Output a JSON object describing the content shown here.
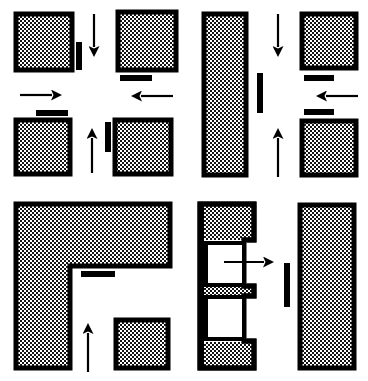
{
  "figure": {
    "title": "",
    "type": "patent-line-diagram",
    "background_color": "#ffffff",
    "stroke_color": "#000000",
    "fill_pattern": "stipple-dots",
    "fill_base_color": "#ffffff",
    "dot_color": "#000000",
    "panel_count": 4,
    "panels": [
      {
        "id": "panel-top-left",
        "name": "top-left-panel",
        "blocks": [
          {
            "name": "block-tl-a",
            "x": 14,
            "y": 12,
            "w": 60,
            "h": 60
          },
          {
            "name": "block-tl-b",
            "x": 116,
            "y": 10,
            "w": 62,
            "h": 62
          },
          {
            "name": "block-tl-c",
            "x": 14,
            "y": 118,
            "w": 58,
            "h": 58
          },
          {
            "name": "block-tl-d",
            "x": 113,
            "y": 118,
            "w": 60,
            "h": 58
          }
        ],
        "bars": [
          {
            "name": "bar-vertical-tl",
            "orientation": "vertical",
            "x": 74,
            "y": 40,
            "w": 7,
            "h": 28
          },
          {
            "name": "bar-horizontal-tl-upper",
            "orientation": "horizontal",
            "x": 119,
            "y": 74,
            "w": 32,
            "h": 6
          },
          {
            "name": "bar-horizontal-tl-lower",
            "orientation": "horizontal",
            "x": 34,
            "y": 109,
            "w": 32,
            "h": 6
          },
          {
            "name": "bar-vertical-tl-right",
            "orientation": "vertical",
            "x": 105,
            "y": 120,
            "w": 7,
            "h": 30
          }
        ],
        "arrows": [
          {
            "name": "arrow-down-tl",
            "direction": "down",
            "x": 93,
            "y": 12,
            "length": 44
          },
          {
            "name": "arrow-right-tl",
            "direction": "right",
            "x": 18,
            "y": 92,
            "length": 44
          },
          {
            "name": "arrow-left-tl",
            "direction": "left",
            "x": 128,
            "y": 93,
            "length": 45
          },
          {
            "name": "arrow-up-tl",
            "direction": "up",
            "x": 90,
            "y": 124,
            "length": 48
          }
        ]
      },
      {
        "id": "panel-top-right",
        "name": "top-right-panel",
        "blocks": [
          {
            "name": "block-tr-tall",
            "x": 202,
            "y": 12,
            "w": 46,
            "h": 165
          },
          {
            "name": "block-tr-a",
            "x": 300,
            "y": 12,
            "w": 58,
            "h": 58
          },
          {
            "name": "block-tr-b",
            "x": 300,
            "y": 119,
            "w": 58,
            "h": 58
          }
        ],
        "bars": [
          {
            "name": "bar-vertical-tr",
            "orientation": "vertical",
            "x": 256,
            "y": 72,
            "w": 7,
            "h": 40
          },
          {
            "name": "bar-horizontal-tr-upper",
            "orientation": "horizontal",
            "x": 303,
            "y": 74,
            "w": 30,
            "h": 6
          },
          {
            "name": "bar-horizontal-tr-lower",
            "orientation": "horizontal",
            "x": 303,
            "y": 108,
            "w": 30,
            "h": 6
          }
        ],
        "arrows": [
          {
            "name": "arrow-down-tr",
            "direction": "down",
            "x": 277,
            "y": 12,
            "length": 44
          },
          {
            "name": "arrow-left-tr",
            "direction": "left",
            "x": 313,
            "y": 92,
            "length": 45
          },
          {
            "name": "arrow-up-tr",
            "direction": "up",
            "x": 277,
            "y": 124,
            "length": 52
          }
        ]
      },
      {
        "id": "panel-bottom-left",
        "name": "bottom-left-panel",
        "blocks": [
          {
            "name": "block-bl-lshape",
            "shape": "L",
            "x": 14,
            "y": 202,
            "w": 158,
            "h": 168,
            "notch_x": 68,
            "notch_y": 76
          },
          {
            "name": "block-bl-square",
            "x": 114,
            "y": 318,
            "w": 56,
            "h": 52
          }
        ],
        "bars": [
          {
            "name": "bar-horizontal-bl",
            "orientation": "horizontal",
            "x": 80,
            "y": 270,
            "w": 34,
            "h": 6
          }
        ],
        "arrows": [
          {
            "name": "arrow-up-bl",
            "direction": "up",
            "x": 88,
            "y": 328,
            "length": 48
          }
        ]
      },
      {
        "id": "panel-bottom-right",
        "name": "bottom-right-panel",
        "blocks": [
          {
            "name": "block-br-bracket",
            "shape": "bracket-with-two-cavities",
            "x": 198,
            "y": 202,
            "w": 60,
            "h": 168
          },
          {
            "name": "block-br-tall",
            "x": 298,
            "y": 203,
            "w": 58,
            "h": 167
          }
        ],
        "cavities": [
          {
            "name": "cavity-upper",
            "x": 206,
            "y": 244,
            "w": 38,
            "h": 42
          },
          {
            "name": "cavity-lower",
            "x": 206,
            "y": 297,
            "w": 38,
            "h": 42
          }
        ],
        "bars": [
          {
            "name": "bar-vertical-br",
            "orientation": "vertical",
            "x": 283,
            "y": 262,
            "w": 7,
            "h": 44
          }
        ],
        "arrows": [
          {
            "name": "arrow-right-br",
            "direction": "right",
            "x": 224,
            "y": 258,
            "length": 52
          }
        ]
      }
    ],
    "legend": {
      "arrow_meaning": "direction of travel",
      "stipple_meaning": "solid body",
      "bar_meaning": "fixed stop"
    }
  }
}
